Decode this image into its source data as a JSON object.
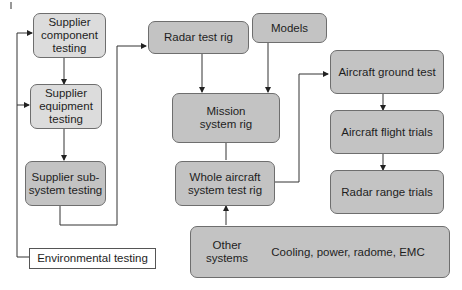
{
  "diagram": {
    "nodes": {
      "supplier_component": "Supplier component testing",
      "supplier_equipment": "Supplier equipment testing",
      "supplier_subsystem": "Supplier sub-system testing",
      "environmental": "Environmental testing",
      "radar_test_rig": "Radar test rig",
      "models": "Models",
      "mission_system_rig": "Mission system rig",
      "whole_aircraft_rig": "Whole aircraft system test rig",
      "other_systems_label": "Other systems",
      "other_systems_detail": "Cooling, power, radome, EMC",
      "aircraft_ground_test": "Aircraft ground test",
      "aircraft_flight_trials": "Aircraft flight trials",
      "radar_range_trials": "Radar range trials"
    },
    "edges": [
      [
        "Supplier component testing",
        "Supplier equipment testing"
      ],
      [
        "Supplier equipment testing",
        "Supplier sub-system testing"
      ],
      [
        "Supplier sub-system testing",
        "Radar test rig"
      ],
      [
        "Environmental testing",
        "Supplier component testing"
      ],
      [
        "Environmental testing",
        "Supplier equipment testing"
      ],
      [
        "Radar test rig",
        "Mission system rig"
      ],
      [
        "Models",
        "Mission system rig"
      ],
      [
        "Mission system rig",
        "Whole aircraft system test rig"
      ],
      [
        "Other systems",
        "Whole aircraft system test rig"
      ],
      [
        "Whole aircraft system test rig",
        "Aircraft ground test"
      ],
      [
        "Aircraft ground test",
        "Aircraft flight trials"
      ],
      [
        "Aircraft flight trials",
        "Radar range trials"
      ]
    ],
    "colors": {
      "light_fill": "#dcdcdc",
      "dark_fill": "#c3c3c3",
      "line": "#333333"
    }
  }
}
